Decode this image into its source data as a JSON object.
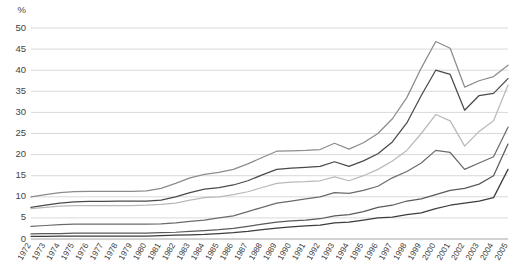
{
  "chart_data": {
    "type": "line",
    "title": "",
    "subtitle": "",
    "xlabel": "",
    "ylabel": "%",
    "unit_label": "%",
    "ylim": [
      0,
      50
    ],
    "ytick_step": 5,
    "yticks": [
      "0",
      "5",
      "10",
      "15",
      "20",
      "25",
      "30",
      "35",
      "40",
      "45",
      "50"
    ],
    "grid": true,
    "legend": "none",
    "x": [
      "1972",
      "1973",
      "1974",
      "1975",
      "1976",
      "1977",
      "1978",
      "1979",
      "1980",
      "1981",
      "1982",
      "1983",
      "1984",
      "1985",
      "1986",
      "1987",
      "1988",
      "1989",
      "1990",
      "1991",
      "1992",
      "1993",
      "1994",
      "1995",
      "1996",
      "1997",
      "1998",
      "1999",
      "2000",
      "2001",
      "2002",
      "2003",
      "2004",
      "2005"
    ],
    "series": [
      {
        "name": "series-1",
        "color": "#8c8c8c",
        "values": [
          10.0,
          10.5,
          11.0,
          11.2,
          11.3,
          11.3,
          11.3,
          11.3,
          11.4,
          12.0,
          13.2,
          14.5,
          15.3,
          15.8,
          16.5,
          17.8,
          19.3,
          20.8,
          20.9,
          21.0,
          21.2,
          22.7,
          21.3,
          22.8,
          25.0,
          28.5,
          33.5,
          40.5,
          46.8,
          45.2,
          36.0,
          37.5,
          38.5,
          41.2
        ]
      },
      {
        "name": "series-2",
        "color": "#4a4a4a",
        "values": [
          7.5,
          8.0,
          8.5,
          8.8,
          8.9,
          8.9,
          9.0,
          9.0,
          9.0,
          9.2,
          10.0,
          11.0,
          11.8,
          12.2,
          12.8,
          13.8,
          15.2,
          16.5,
          16.8,
          17.0,
          17.2,
          18.3,
          17.2,
          18.5,
          20.2,
          23.0,
          27.5,
          34.0,
          40.0,
          39.0,
          30.5,
          34.0,
          34.5,
          38.0
        ]
      },
      {
        "name": "series-3",
        "color": "#b9b9b9",
        "values": [
          7.2,
          7.5,
          7.8,
          7.9,
          7.9,
          7.9,
          7.9,
          7.9,
          8.0,
          8.2,
          8.5,
          9.2,
          9.8,
          10.0,
          10.5,
          11.2,
          12.2,
          13.2,
          13.5,
          13.6,
          13.8,
          14.7,
          13.8,
          15.0,
          16.5,
          18.5,
          21.0,
          25.0,
          29.5,
          28.0,
          22.0,
          25.5,
          28.0,
          36.5
        ]
      },
      {
        "name": "series-4",
        "color": "#6b6b6b",
        "values": [
          3.0,
          3.2,
          3.4,
          3.5,
          3.5,
          3.5,
          3.5,
          3.5,
          3.5,
          3.6,
          3.8,
          4.2,
          4.5,
          5.0,
          5.5,
          6.5,
          7.5,
          8.5,
          9.0,
          9.5,
          10.0,
          11.0,
          10.8,
          11.5,
          12.5,
          14.5,
          16.0,
          18.0,
          21.0,
          20.5,
          16.5,
          18.0,
          19.5,
          26.5
        ]
      },
      {
        "name": "series-5",
        "color": "#5a5a5a",
        "values": [
          1.2,
          1.3,
          1.3,
          1.4,
          1.4,
          1.4,
          1.4,
          1.4,
          1.4,
          1.5,
          1.6,
          1.8,
          2.0,
          2.2,
          2.5,
          3.0,
          3.5,
          4.0,
          4.3,
          4.5,
          4.8,
          5.5,
          5.8,
          6.5,
          7.5,
          8.0,
          9.0,
          9.5,
          10.5,
          11.5,
          12.0,
          13.0,
          15.0,
          22.5
        ]
      },
      {
        "name": "series-6",
        "color": "#3d3d3d",
        "values": [
          0.6,
          0.6,
          0.7,
          0.7,
          0.7,
          0.7,
          0.7,
          0.7,
          0.7,
          0.8,
          0.9,
          1.0,
          1.1,
          1.3,
          1.5,
          1.8,
          2.2,
          2.6,
          2.9,
          3.1,
          3.3,
          3.8,
          4.0,
          4.5,
          5.0,
          5.2,
          5.8,
          6.2,
          7.2,
          8.0,
          8.5,
          9.0,
          9.8,
          16.5
        ]
      }
    ]
  },
  "axes": {
    "plot_left": 31,
    "plot_right": 508,
    "plot_top": 28,
    "plot_bottom": 239
  }
}
